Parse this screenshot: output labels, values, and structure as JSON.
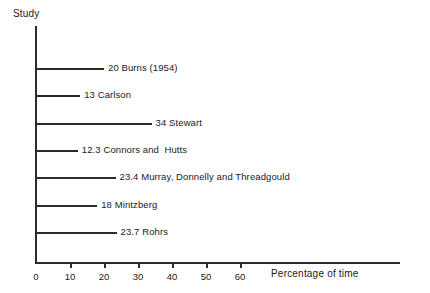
{
  "chart_data": {
    "type": "bar",
    "orientation": "horizontal",
    "title": "",
    "ylabel": "Study",
    "xlabel": "Percentage of time",
    "xlim": [
      0,
      60
    ],
    "xticks": [
      0,
      10,
      20,
      30,
      40,
      50,
      60
    ],
    "xtick_labels": [
      "0",
      "10",
      "20",
      "30",
      "40",
      "50",
      "60"
    ],
    "grid": false,
    "legend": false,
    "categories": [
      "Burns (1954)",
      "Carlson",
      "Stewart",
      "Connors and  Hutts",
      "Murray, Donnelly and Threadgould",
      "Mintzberg",
      "Rohrs"
    ],
    "values": [
      20,
      13,
      34,
      12.3,
      23.4,
      18,
      23.7
    ],
    "bars": [
      {
        "value": 20,
        "value_text": "20",
        "name": "Burns (1954)",
        "label": "20 Burns (1954)"
      },
      {
        "value": 13,
        "value_text": "13",
        "name": "Carlson",
        "label": "13 Carlson"
      },
      {
        "value": 34,
        "value_text": "34",
        "name": "Stewart",
        "label": "34 Stewart"
      },
      {
        "value": 12.3,
        "value_text": "12.3",
        "name": "Connors and  Hutts",
        "label": "12.3 Connors and  Hutts"
      },
      {
        "value": 23.4,
        "value_text": "23.4",
        "name": "Murray, Donnelly and Threadgould",
        "label": "23.4 Murray, Donnelly and Threadgould"
      },
      {
        "value": 18,
        "value_text": "18",
        "name": "Mintzberg",
        "label": "18 Mintzberg"
      },
      {
        "value": 23.7,
        "value_text": "23.7",
        "name": "Rohrs",
        "label": "23.7 Rohrs"
      }
    ],
    "colors": {
      "bar": "#2b2b2b",
      "axis": "#2b2b2b",
      "text": "#1a1a1a",
      "background": "#ffffff"
    }
  }
}
